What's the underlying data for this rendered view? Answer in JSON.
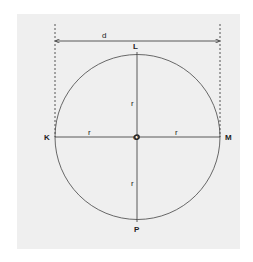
{
  "diagram": {
    "type": "circle-diameter-radius",
    "colors": {
      "background": "#efefef",
      "stroke": "#333333",
      "text": "#222222"
    },
    "diameter_label": "d",
    "center_label": "O",
    "points": {
      "top": "L",
      "left": "K",
      "right": "M",
      "bottom": "P"
    },
    "radius_labels": {
      "top": "r",
      "left": "r",
      "right": "r",
      "bottom": "r"
    }
  }
}
